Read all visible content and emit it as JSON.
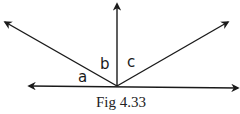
{
  "figure": {
    "caption": "Fig 4.33",
    "labels": {
      "a": "a",
      "b": "b",
      "c": "c"
    },
    "colors": {
      "stroke": "#1a1a1a",
      "background": "#ffffff"
    },
    "geometry": {
      "vertex": [
        117,
        86
      ],
      "rays": [
        {
          "name": "left-horizontal",
          "to": [
            29,
            86
          ]
        },
        {
          "name": "right-horizontal",
          "to": [
            238,
            88
          ]
        },
        {
          "name": "vertical-up",
          "to": [
            117,
            4
          ]
        },
        {
          "name": "upper-left",
          "to": [
            5,
            22
          ]
        },
        {
          "name": "upper-right",
          "to": [
            228,
            22
          ]
        }
      ]
    }
  }
}
